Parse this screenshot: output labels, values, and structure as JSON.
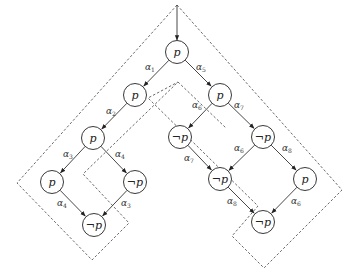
{
  "diagram": {
    "title": "",
    "entry_arrow": {
      "x": 177,
      "y1": 5,
      "y2": 40
    },
    "node_radius": 11.5,
    "nodes": [
      {
        "id": "n1",
        "x": 177,
        "y": 52,
        "label": "p"
      },
      {
        "id": "n2",
        "x": 135,
        "y": 95,
        "label": "p"
      },
      {
        "id": "n3",
        "x": 93,
        "y": 138,
        "label": "p"
      },
      {
        "id": "n4",
        "x": 52,
        "y": 182,
        "label": "p"
      },
      {
        "id": "n5",
        "x": 135,
        "y": 182,
        "label": "¬p"
      },
      {
        "id": "n6",
        "x": 94,
        "y": 225,
        "label": "¬p"
      },
      {
        "id": "n7",
        "x": 220,
        "y": 95,
        "label": "p"
      },
      {
        "id": "n8",
        "x": 180,
        "y": 137,
        "label": "¬p"
      },
      {
        "id": "n9",
        "x": 263,
        "y": 137,
        "label": "¬p"
      },
      {
        "id": "n10",
        "x": 220,
        "y": 179,
        "label": "¬p"
      },
      {
        "id": "n11",
        "x": 305,
        "y": 179,
        "label": "p"
      },
      {
        "id": "n12",
        "x": 263,
        "y": 222,
        "label": "¬p"
      }
    ],
    "edges": [
      {
        "from": "n1",
        "to": "n2",
        "label": "α",
        "sub": "1",
        "lx": 145,
        "ly": 70
      },
      {
        "from": "n1",
        "to": "n7",
        "label": "α",
        "sub": "5",
        "lx": 196,
        "ly": 70
      },
      {
        "from": "n2",
        "to": "n3",
        "label": "α",
        "sub": "2",
        "lx": 106,
        "ly": 114
      },
      {
        "from": "n3",
        "to": "n4",
        "label": "α",
        "sub": "3",
        "lx": 63,
        "ly": 157
      },
      {
        "from": "n3",
        "to": "n5",
        "label": "α",
        "sub": "4",
        "lx": 115,
        "ly": 157
      },
      {
        "from": "n4",
        "to": "n6",
        "label": "α",
        "sub": "4",
        "lx": 57,
        "ly": 206
      },
      {
        "from": "n5",
        "to": "n6",
        "label": "α",
        "sub": "3",
        "lx": 121,
        "ly": 206
      },
      {
        "from": "n7",
        "to": "n8",
        "label": "α",
        "sub": "6",
        "lx": 192,
        "ly": 108
      },
      {
        "from": "n7",
        "to": "n9",
        "label": "α",
        "sub": "7",
        "lx": 234,
        "ly": 108
      },
      {
        "from": "n8",
        "to": "n10",
        "label": "α",
        "sub": "7",
        "lx": 184,
        "ly": 161
      },
      {
        "from": "n9",
        "to": "n10",
        "label": "α",
        "sub": "6",
        "lx": 234,
        "ly": 151
      },
      {
        "from": "n9",
        "to": "n11",
        "label": "α",
        "sub": "8",
        "lx": 282,
        "ly": 151
      },
      {
        "from": "n10",
        "to": "n12",
        "label": "α",
        "sub": "8",
        "lx": 227,
        "ly": 204
      },
      {
        "from": "n11",
        "to": "n12",
        "label": "α",
        "sub": "6",
        "lx": 291,
        "ly": 204
      }
    ],
    "outlines": [
      {
        "name": "outer-region",
        "points": "177,5 17,183 92,260 128,222 83,174 177,80 226,128 170,185 264,268 342,190"
      },
      {
        "name": "inner-region",
        "points": "184,88 140,132 150,140 200,118 244,161 230,170 264,180 196,106"
      }
    ]
  }
}
